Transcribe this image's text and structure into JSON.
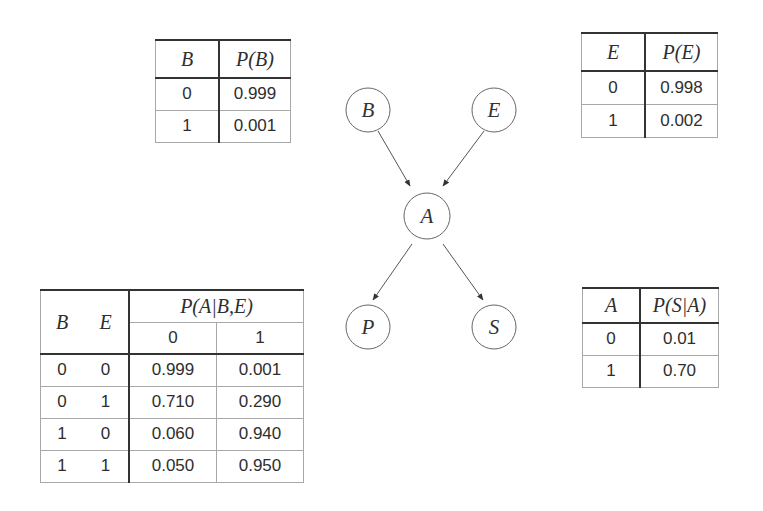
{
  "diagram": {
    "nodes": [
      {
        "id": "B",
        "label": "B",
        "cx": 368,
        "cy": 110
      },
      {
        "id": "E",
        "label": "E",
        "cx": 494,
        "cy": 110
      },
      {
        "id": "A",
        "label": "A",
        "cx": 427,
        "cy": 216
      },
      {
        "id": "P",
        "label": "P",
        "cx": 368,
        "cy": 327
      },
      {
        "id": "S",
        "label": "S",
        "cx": 494,
        "cy": 327
      }
    ],
    "edges": [
      {
        "from": "B",
        "to": "A"
      },
      {
        "from": "E",
        "to": "A"
      },
      {
        "from": "A",
        "to": "P"
      },
      {
        "from": "A",
        "to": "S"
      }
    ]
  },
  "table_b": {
    "headers": [
      "B",
      "P(B)"
    ],
    "rows": [
      [
        "0",
        "0.999"
      ],
      [
        "1",
        "0.001"
      ]
    ]
  },
  "table_e": {
    "headers": [
      "E",
      "P(E)"
    ],
    "rows": [
      [
        "0",
        "0.998"
      ],
      [
        "1",
        "0.002"
      ]
    ]
  },
  "table_a": {
    "headers": {
      "b": "B",
      "e": "E",
      "p": "P(A|B,E)",
      "a0": "0",
      "a1": "1"
    },
    "rows": [
      [
        "0",
        "0",
        "0.999",
        "0.001"
      ],
      [
        "0",
        "1",
        "0.710",
        "0.290"
      ],
      [
        "1",
        "0",
        "0.060",
        "0.940"
      ],
      [
        "1",
        "1",
        "0.050",
        "0.950"
      ]
    ]
  },
  "table_s": {
    "headers": [
      "A",
      "P(S|A)"
    ],
    "rows": [
      [
        "0",
        "0.01"
      ],
      [
        "1",
        "0.70"
      ]
    ]
  }
}
